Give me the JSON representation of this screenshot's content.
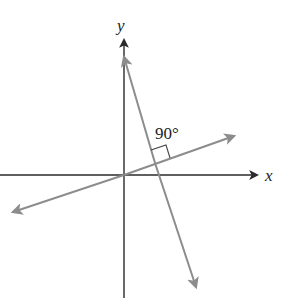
{
  "figure": {
    "axes": {
      "x_label": "x",
      "y_label": "y"
    },
    "angle_label": "90°",
    "lines": [
      {
        "name": "shallow-line",
        "description": "line with positive slope through origin"
      },
      {
        "name": "steep-line",
        "description": "line with negative slope, perpendicular to shallow line"
      }
    ],
    "colors": {
      "axis": "#2a2a2a",
      "lines": "#8c8c8c",
      "background": "#ffffff"
    }
  }
}
